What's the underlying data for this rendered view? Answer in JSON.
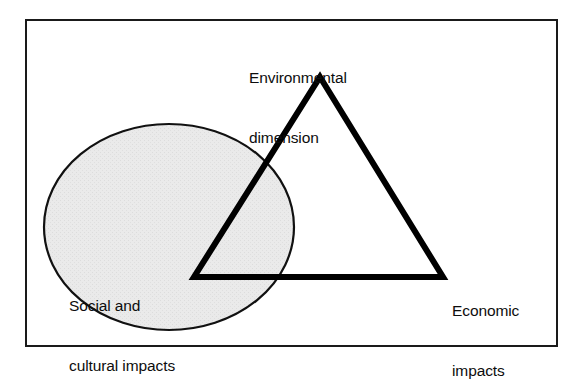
{
  "figure": {
    "type": "venn-overlap-diagram",
    "frame": {
      "x": 25,
      "y": 19,
      "width": 533,
      "height": 328,
      "stroke_color": "#1a1a1a",
      "stroke_width": 2,
      "fill_color": "#ffffff"
    },
    "shapes": [
      {
        "name": "social-cultural-ellipse",
        "kind": "ellipse",
        "cx": 169,
        "cy": 227,
        "rx": 125,
        "ry": 103,
        "fill_color": "#e9e9e9",
        "stroke_color": "#111111",
        "stroke_width": 2.2
      },
      {
        "name": "sustainability-triangle",
        "kind": "triangle",
        "points": "320,77 443,277 194,277",
        "apex": {
          "x": 320,
          "y": 77
        },
        "bottom_right": {
          "x": 443,
          "y": 277
        },
        "bottom_left": {
          "x": 194,
          "y": 277
        },
        "fill_color": "none",
        "stroke_color": "#000000",
        "stroke_width": 6
      }
    ],
    "labels": {
      "environmental": {
        "name": "environmental-dimension-label",
        "line1": "Environmental",
        "line2": "dimension",
        "anchor": "triangle-apex"
      },
      "social": {
        "name": "social-cultural-impacts-label",
        "line1": "Social and",
        "line2": "cultural impacts",
        "anchor": "ellipse-interior"
      },
      "economic": {
        "name": "economic-impacts-label",
        "line1": "Economic",
        "line2": "impacts",
        "anchor": "triangle-bottom-right"
      }
    },
    "colors": {
      "ink": "#0d0d0d",
      "shade": "#e9e9e9",
      "frame": "#1a1a1a",
      "page": "#ffffff"
    }
  }
}
